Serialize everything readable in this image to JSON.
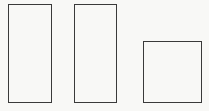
{
  "diagram": {
    "background_color": "#f8f8f6",
    "stroke_color": "#3a3a3a",
    "shapes": [
      {
        "type": "rectangle",
        "label": "",
        "x": 8,
        "y": 4,
        "width": 44,
        "height": 99
      },
      {
        "type": "rectangle",
        "label": "",
        "x": 74,
        "y": 4,
        "width": 43,
        "height": 99
      },
      {
        "type": "rectangle",
        "label": "",
        "x": 143,
        "y": 41,
        "width": 59,
        "height": 62
      }
    ]
  }
}
